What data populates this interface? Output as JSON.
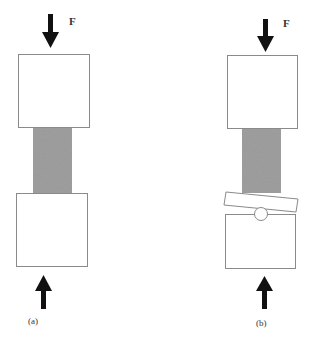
{
  "figure": {
    "panels": [
      {
        "id": "a",
        "caption": "(a)",
        "force_label": "F",
        "top_arrow": "arrow-down",
        "bottom_arrow": "arrow-up",
        "setup": "rigid flat platens"
      },
      {
        "id": "b",
        "caption": "(b)",
        "force_label": "F",
        "top_arrow": "arrow-down",
        "bottom_arrow": "arrow-up",
        "setup": "spherical seat with tilted platen"
      }
    ],
    "colors": {
      "outline": "#8a8a8a",
      "arrow": "#111111",
      "specimen": "#8c8c8c",
      "background": "#ffffff"
    }
  }
}
